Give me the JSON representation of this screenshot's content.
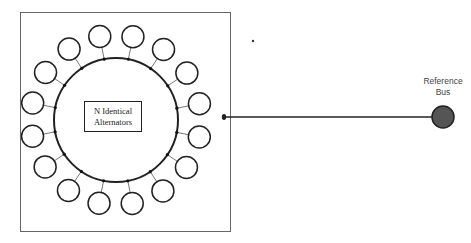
{
  "diagram": {
    "center_label": {
      "line1": "N Identical",
      "line2": "Alternators"
    },
    "reference_bus": {
      "line1": "Reference",
      "line2": "Bus",
      "fill": "#555555"
    },
    "alternator_count_drawn": 16,
    "colors": {
      "stroke": "#222222",
      "box": "#666666"
    }
  }
}
